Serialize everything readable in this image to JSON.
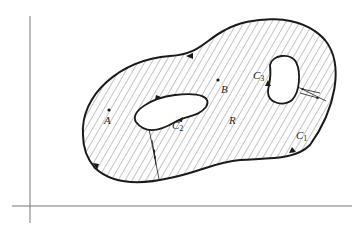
{
  "diagram": {
    "type": "multiply-connected region (Green's theorem)",
    "region_label": "R",
    "points": [
      {
        "id": "A",
        "label": "A"
      },
      {
        "id": "B",
        "label": "B"
      }
    ],
    "curves": [
      {
        "id": "C1",
        "label": "C",
        "sub": "1",
        "role": "outer boundary"
      },
      {
        "id": "C2",
        "label": "C",
        "sub": "2",
        "role": "inner boundary (hole)"
      },
      {
        "id": "C3",
        "label": "C",
        "sub": "3",
        "role": "inner boundary (hole)"
      }
    ],
    "colors": {
      "stroke": "#1a1a1a",
      "hatch": "#555555",
      "axis": "#777777",
      "background": "#ffffff"
    }
  }
}
